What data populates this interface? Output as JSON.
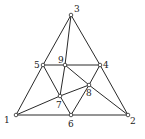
{
  "diagram": {
    "type": "graph",
    "nodes": [
      {
        "id": "1",
        "label": "1",
        "x": 16,
        "y": 115,
        "lx": 4,
        "ly": 123
      },
      {
        "id": "2",
        "label": "2",
        "x": 128,
        "y": 115,
        "lx": 130,
        "ly": 124
      },
      {
        "id": "3",
        "label": "3",
        "x": 71,
        "y": 15,
        "lx": 74,
        "ly": 12
      },
      {
        "id": "4",
        "label": "4",
        "x": 100,
        "y": 65,
        "lx": 103,
        "ly": 68
      },
      {
        "id": "5",
        "label": "5",
        "x": 43,
        "y": 65,
        "lx": 34,
        "ly": 68
      },
      {
        "id": "6",
        "label": "6",
        "x": 71,
        "y": 115,
        "lx": 68,
        "ly": 127
      },
      {
        "id": "7",
        "label": "7",
        "x": 60,
        "y": 96,
        "lx": 56,
        "ly": 108
      },
      {
        "id": "8",
        "label": "8",
        "x": 89,
        "y": 85,
        "lx": 86,
        "ly": 96
      },
      {
        "id": "9",
        "label": "9",
        "x": 65,
        "y": 65,
        "lx": 58,
        "ly": 63
      }
    ],
    "edges": [
      [
        "1",
        "5"
      ],
      [
        "5",
        "3"
      ],
      [
        "3",
        "4"
      ],
      [
        "4",
        "2"
      ],
      [
        "1",
        "6"
      ],
      [
        "6",
        "2"
      ],
      [
        "5",
        "9"
      ],
      [
        "9",
        "4"
      ],
      [
        "3",
        "9"
      ],
      [
        "9",
        "7"
      ],
      [
        "5",
        "7"
      ],
      [
        "7",
        "6"
      ],
      [
        "1",
        "7"
      ],
      [
        "7",
        "8"
      ],
      [
        "8",
        "4"
      ],
      [
        "9",
        "8"
      ],
      [
        "8",
        "2"
      ],
      [
        "8",
        "6"
      ]
    ],
    "colors": {
      "stroke": "#2a2a2a",
      "node_fill": "#ffffff",
      "label": "#222222"
    }
  }
}
